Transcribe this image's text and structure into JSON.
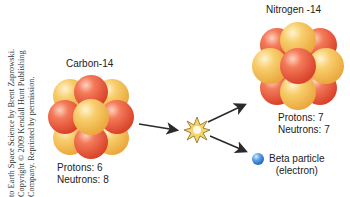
{
  "credit": {
    "lines": [
      "to Earth Space Science by Brent Zaprowski.",
      "Copyright © 2009 Kendall Hunt Publishing",
      "Company. Reprinted by permission."
    ]
  },
  "carbon": {
    "title": "Carbon-14",
    "protons_label": "Protons: 6",
    "neutrons_label": "Neutrons: 8"
  },
  "nitrogen": {
    "title": "Nitrogen -14",
    "protons_label": "Protons: 7",
    "neutrons_label": "Neutrons: 7"
  },
  "beta": {
    "line1": "Beta particle",
    "line2": "(electron)"
  },
  "colors": {
    "proton": "#ee5a3c",
    "neutron": "#f6c15a",
    "electron": "#4a90d9",
    "arrow": "#2a2a2a",
    "burst": "#f3d36b"
  }
}
